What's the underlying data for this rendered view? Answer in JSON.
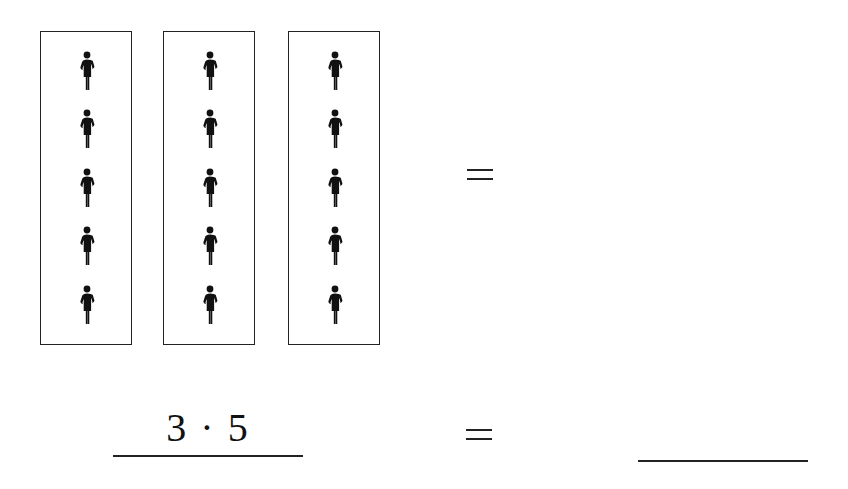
{
  "worksheet": {
    "groups": [
      {
        "label": "group-1",
        "count": 5
      },
      {
        "label": "group-2",
        "count": 5
      },
      {
        "label": "group-3",
        "count": 5
      }
    ],
    "figure_icon": "person-icon",
    "equals_top": "=",
    "expression": "3 · 5",
    "equals_bottom": "=",
    "answer": ""
  }
}
